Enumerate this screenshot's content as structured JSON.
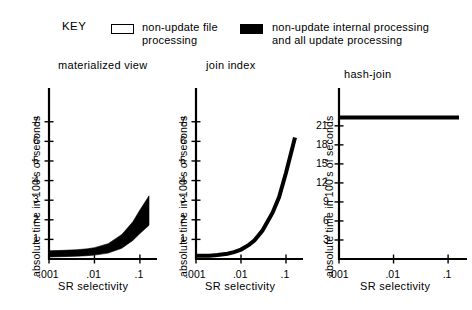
{
  "key": {
    "title": "KEY",
    "entries": [
      {
        "swatch": "open-square-swatch",
        "fill": "#ffffff",
        "label": "non-update file\nprocessing"
      },
      {
        "swatch": "filled-square-swatch",
        "fill": "#000000",
        "label": "non-update internal processing\nand all update processing"
      }
    ]
  },
  "chart_data": [
    {
      "type": "area",
      "title": "materialized view",
      "xlabel": "SR selectivity",
      "ylabel": "absolute time in 100's of seconds",
      "xscale": "log",
      "xlim": [
        0.001,
        0.1585
      ],
      "ylim": [
        0,
        7.6
      ],
      "xticks": [
        0.001,
        0.01,
        0.1
      ],
      "xticklabels": [
        ".001",
        ".01",
        ".1"
      ],
      "yticks": [
        1,
        2,
        3,
        4,
        5,
        6,
        7
      ],
      "yticklabels": [
        "1",
        "2",
        "3",
        "4",
        "5",
        "6",
        "7"
      ],
      "grid": false,
      "legend": "external-key",
      "series": [
        {
          "name": "non-update internal processing and all update processing",
          "fill": "#000000",
          "x": [
            0.001,
            0.002,
            0.004,
            0.007,
            0.01,
            0.02,
            0.04,
            0.07,
            0.1,
            0.1585
          ],
          "lower": [
            0.1,
            0.12,
            0.14,
            0.17,
            0.2,
            0.3,
            0.55,
            0.95,
            1.3,
            1.72
          ],
          "upper": [
            0.42,
            0.44,
            0.47,
            0.52,
            0.58,
            0.78,
            1.25,
            1.9,
            2.5,
            3.22
          ]
        }
      ]
    },
    {
      "type": "line",
      "title": "join index",
      "xlabel": "SR selectivity",
      "ylabel": "absolute time in 100's of seconds",
      "xscale": "log",
      "xlim": [
        0.001,
        0.1585
      ],
      "ylim": [
        0,
        7.6
      ],
      "xticks": [
        0.001,
        0.01,
        0.1
      ],
      "xticklabels": [
        ".001",
        ".01",
        ".1"
      ],
      "yticks": [
        1,
        2,
        3,
        4,
        5,
        6,
        7
      ],
      "yticklabels": [
        "1",
        "2",
        "3",
        "4",
        "5",
        "6",
        "7"
      ],
      "grid": false,
      "legend": "external-key",
      "series": [
        {
          "name": "non-update internal processing and all update processing",
          "color": "#000000",
          "linewidth": 4,
          "x": [
            0.001,
            0.0015,
            0.002,
            0.003,
            0.005,
            0.007,
            0.01,
            0.015,
            0.02,
            0.03,
            0.05,
            0.07,
            0.1,
            0.1585
          ],
          "y": [
            0.16,
            0.16,
            0.17,
            0.2,
            0.27,
            0.35,
            0.48,
            0.72,
            0.95,
            1.45,
            2.35,
            3.15,
            4.4,
            6.2
          ]
        }
      ]
    },
    {
      "type": "line",
      "title": "hash-join",
      "xlabel": "SR selectivity",
      "ylabel": "absolute time in 100's of seconds",
      "xscale": "log",
      "xlim": [
        0.001,
        0.1585
      ],
      "ylim": [
        0,
        23.5
      ],
      "xticks": [
        0.001,
        0.01,
        0.1
      ],
      "xticklabels": [
        ".001",
        ".01",
        ".1"
      ],
      "yticks": [
        3,
        6,
        9,
        12,
        15,
        18,
        21
      ],
      "yticklabels": [
        "3",
        "6",
        "9",
        "12",
        "15",
        "18",
        "21"
      ],
      "grid": false,
      "legend": "external-key",
      "series": [
        {
          "name": "non-update internal processing and all update processing",
          "color": "#000000",
          "linewidth": 4,
          "x": [
            0.001,
            0.01,
            0.1,
            0.1585
          ],
          "y": [
            22.3,
            22.3,
            22.3,
            22.3
          ]
        }
      ]
    }
  ]
}
